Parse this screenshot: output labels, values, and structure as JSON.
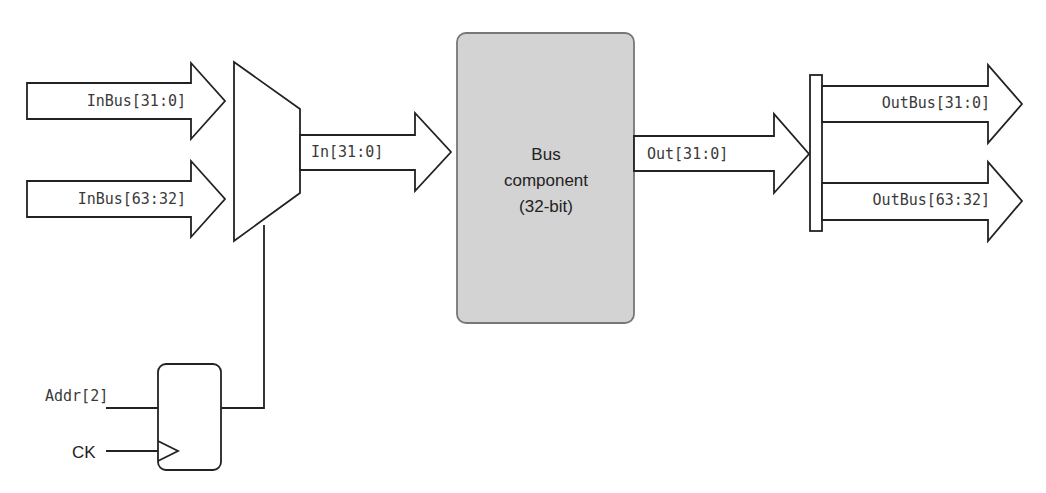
{
  "diagram": {
    "inputs": [
      {
        "label": "InBus[31:0]"
      },
      {
        "label": "InBus[63:32]"
      }
    ],
    "mux_output": {
      "label": "In[31:0]"
    },
    "component": {
      "line1": "Bus",
      "line2": "component",
      "line3": "(32-bit)",
      "fill": "#d3d3d3"
    },
    "component_output": {
      "label": "Out[31:0]"
    },
    "outputs": [
      {
        "label": "OutBus[31:0]"
      },
      {
        "label": "OutBus[63:32]"
      }
    ],
    "register": {
      "data_input": "Addr[2]",
      "clock_input": "CK"
    }
  }
}
